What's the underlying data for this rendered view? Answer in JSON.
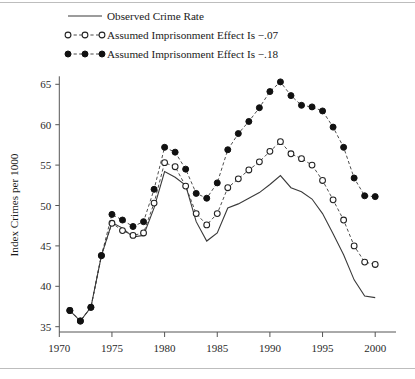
{
  "chart_data": {
    "type": "line",
    "title": "",
    "xlabel": "",
    "ylabel": "Index Crimes per 1000",
    "xlim": [
      1969.0,
      2001.5
    ],
    "ylim": [
      33.8,
      66.5
    ],
    "xticks": [
      1970,
      1975,
      1980,
      1985,
      1990,
      1995,
      2000
    ],
    "yticks": [
      35,
      40,
      45,
      50,
      55,
      60,
      65
    ],
    "xtick_labels": [
      "1970",
      "1975",
      "1980",
      "1985",
      "1990",
      "1995",
      "2000"
    ],
    "ytick_labels": [
      "35",
      "40",
      "45",
      "50",
      "55",
      "60",
      "65"
    ],
    "grid": false,
    "legend_position": "top-left",
    "series": [
      {
        "name": "Observed Crime Rate",
        "style": "solid",
        "marker": "none",
        "color": "#3a3a3a",
        "x": [
          1971,
          1972,
          1973,
          1974,
          1975,
          1976,
          1977,
          1978,
          1979,
          1980,
          1981,
          1982,
          1983,
          1984,
          1985,
          1986,
          1987,
          1988,
          1989,
          1990,
          1991,
          1992,
          1993,
          1994,
          1995,
          1996,
          1997,
          1998,
          1999,
          2000
        ],
        "y": [
          37.0,
          35.7,
          37.4,
          43.8,
          47.9,
          47.2,
          46.1,
          46.3,
          49.7,
          54.2,
          53.5,
          52.5,
          48.0,
          45.6,
          46.6,
          49.7,
          50.2,
          50.9,
          51.6,
          52.6,
          53.7,
          52.2,
          51.7,
          50.8,
          49.0,
          46.5,
          43.9,
          40.8,
          38.8,
          38.6
        ]
      },
      {
        "name": "Assumed Imprisonment Effect Is −.07",
        "style": "dashed",
        "marker": "open-circle",
        "color": "#222222",
        "x": [
          1971,
          1972,
          1973,
          1974,
          1975,
          1976,
          1977,
          1978,
          1979,
          1980,
          1981,
          1982,
          1983,
          1984,
          1985,
          1986,
          1987,
          1988,
          1989,
          1990,
          1991,
          1992,
          1993,
          1994,
          1995,
          1996,
          1997,
          1998,
          1999,
          2000
        ],
        "y": [
          37.0,
          35.7,
          37.4,
          43.8,
          47.8,
          46.9,
          46.3,
          46.6,
          50.3,
          55.3,
          54.8,
          52.4,
          49.0,
          47.6,
          49.0,
          52.2,
          53.3,
          54.4,
          55.4,
          56.7,
          57.9,
          56.4,
          55.8,
          55.0,
          53.1,
          50.7,
          48.2,
          45.0,
          43.0,
          42.7
        ]
      },
      {
        "name": "Assumed Imprisonment Effect Is −.18",
        "style": "dashed",
        "marker": "filled-circle",
        "color": "#111111",
        "x": [
          1971,
          1972,
          1973,
          1974,
          1975,
          1976,
          1977,
          1978,
          1979,
          1980,
          1981,
          1982,
          1983,
          1984,
          1985,
          1986,
          1987,
          1988,
          1989,
          1990,
          1991,
          1992,
          1993,
          1994,
          1995,
          1996,
          1997,
          1998,
          1999,
          2000
        ],
        "y": [
          37.0,
          35.7,
          37.4,
          43.8,
          48.9,
          48.2,
          47.4,
          48.0,
          52.0,
          57.2,
          56.6,
          54.5,
          51.5,
          50.9,
          52.8,
          56.9,
          58.9,
          60.4,
          62.1,
          64.1,
          65.3,
          63.6,
          62.4,
          62.2,
          61.7,
          59.7,
          57.2,
          53.4,
          51.2,
          51.1
        ]
      }
    ]
  },
  "legend": {
    "items": [
      {
        "label": "Observed Crime Rate",
        "style": "solid",
        "marker": "none"
      },
      {
        "label": "Assumed Imprisonment Effect Is −.07",
        "style": "dashed",
        "marker": "open-circle"
      },
      {
        "label": "Assumed Imprisonment Effect Is −.18",
        "style": "dashed",
        "marker": "filled-circle"
      }
    ]
  },
  "axes": {
    "y_title": "Index Crimes per 1000"
  },
  "colors": {
    "ink": "#1a1a1a",
    "axis": "#555555",
    "rule": "#bdbdbd",
    "marker_fill": "#111111",
    "marker_open_fill": "#ffffff"
  }
}
